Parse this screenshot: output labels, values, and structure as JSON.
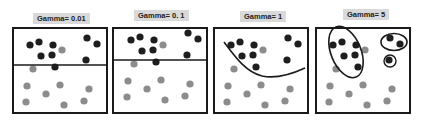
{
  "chart_data": {
    "type": "scatter",
    "panels": [
      {
        "label": "Gamma= 0.01",
        "boundary": "straight horizontal line (y=38 of 87)"
      },
      {
        "label": "Gamma= 0. 1",
        "boundary": "straight horizontal line (y=33 of 87)"
      },
      {
        "label": "Gamma= 1",
        "boundary": "curved U-shaped line"
      },
      {
        "label": "Gamma= 5",
        "boundary": "tight ellipses around dark-class clusters"
      }
    ],
    "series": [
      {
        "name": "class-dark",
        "color": "#1e1e1e",
        "points": [
          [
            18,
            18
          ],
          [
            27,
            15
          ],
          [
            41,
            18
          ],
          [
            29,
            29
          ],
          [
            40,
            28
          ],
          [
            75,
            11
          ],
          [
            85,
            17
          ],
          [
            74,
            33
          ],
          [
            43,
            40
          ]
        ]
      },
      {
        "name": "class-gray",
        "color": "#8c8c8c",
        "points": [
          [
            50,
            23
          ],
          [
            21,
            42
          ],
          [
            15,
            59
          ],
          [
            34,
            67
          ],
          [
            48,
            58
          ],
          [
            77,
            62
          ],
          [
            14,
            75
          ],
          [
            52,
            78
          ],
          [
            72,
            74
          ]
        ]
      }
    ],
    "xlim": [
      0,
      96
    ],
    "ylim": [
      0,
      87
    ],
    "grid": false
  },
  "panels": [
    {
      "label": "Gamma= 0.01"
    },
    {
      "label": "Gamma= 0. 1"
    },
    {
      "label": "Gamma= 1"
    },
    {
      "label": "Gamma= 5"
    }
  ],
  "colors": {
    "dark_dot": "#1e1e1e",
    "gray_dot": "#8c8c8c",
    "label_bg": "#d9d9d9",
    "border": "#1a1a1a"
  }
}
